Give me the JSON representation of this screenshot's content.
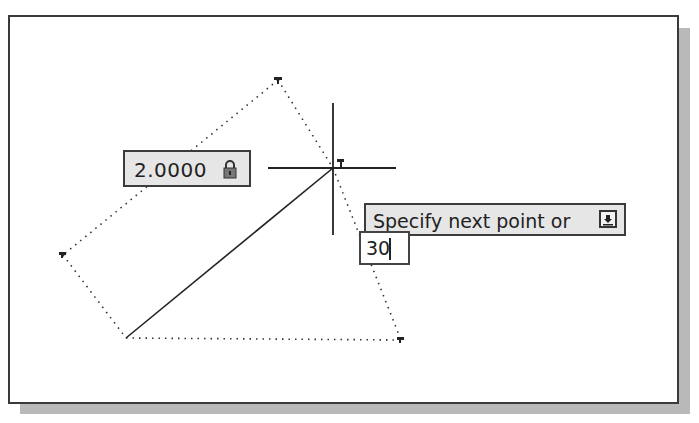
{
  "canvas": {
    "vertices": {
      "top": [
        278,
        80
      ],
      "left": [
        63,
        255
      ],
      "bottom_left": [
        126,
        338
      ],
      "bottom_right": [
        401,
        340
      ],
      "cursor": [
        333,
        168
      ]
    },
    "crosshair": {
      "x": 333,
      "y": 168,
      "v_top": 103,
      "v_bottom": 235,
      "h_left": 268,
      "h_right": 396
    }
  },
  "dynamic_input": {
    "length_field": {
      "value": "2.0000",
      "icon": "lock-icon"
    },
    "prompt": {
      "text": "Specify next point or",
      "icon": "dropdown-arrow-icon"
    },
    "angle_input": {
      "value": "30"
    }
  },
  "colors": {
    "frame": "#3a3a3a",
    "box_bg": "#e6e6e6",
    "shadow": "#b9b9b9"
  }
}
